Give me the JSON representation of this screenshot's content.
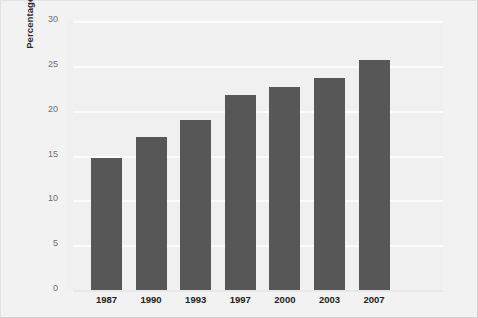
{
  "chart_data": {
    "type": "bar",
    "title": "",
    "xlabel": "",
    "ylabel": "Percentage of Full-Time Sworn Personnel",
    "categories": [
      "1987",
      "1990",
      "1993",
      "1997",
      "2000",
      "2003",
      "2007"
    ],
    "values": [
      14.7,
      17.1,
      19.0,
      21.7,
      22.6,
      23.7,
      25.6
    ],
    "series": [
      {
        "name": "Percentage of Full-Time Sworn Personnel",
        "values": [
          14.7,
          17.1,
          19.0,
          21.7,
          22.6,
          23.7,
          25.6
        ]
      }
    ],
    "ylim": [
      0,
      30
    ],
    "yticks": [
      "0",
      "5",
      "10",
      "15",
      "20",
      "25",
      "30"
    ],
    "ytick_values": [
      0,
      5,
      10,
      15,
      20,
      25,
      30
    ],
    "grid": true,
    "legend": "none",
    "bar_color": "#575757",
    "plot_background": "#f0f0f0",
    "gridline_color": "#fbfbfb",
    "figure_background": "#f2f2f2"
  }
}
